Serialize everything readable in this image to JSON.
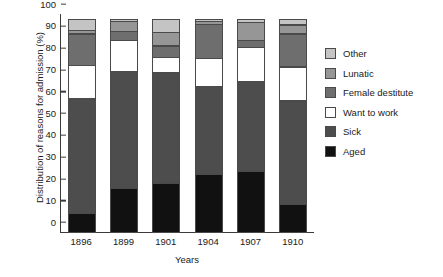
{
  "chart_data": {
    "type": "bar",
    "stacked": true,
    "title": "",
    "xlabel": "Years",
    "ylabel": "Distribution of reasons for admission (%)",
    "categories": [
      "1896",
      "1899",
      "1901",
      "1904",
      "1907",
      "1910"
    ],
    "ylim": [
      0,
      100
    ],
    "yticks": [
      0,
      10,
      20,
      30,
      40,
      50,
      60,
      70,
      80,
      90,
      100
    ],
    "ytick_labels": [
      "0",
      "10",
      "20",
      "30",
      "40",
      "50",
      "60",
      "70",
      "80",
      "90",
      "100"
    ],
    "grid": false,
    "legend_position": "right",
    "units": "percent",
    "series": [
      {
        "name": "Aged",
        "color": "#111111",
        "values": [
          9.0,
          20.5,
          23.0,
          27.0,
          28.5,
          13.0
        ]
      },
      {
        "name": "Sick",
        "color": "#4d4d4d",
        "values": [
          53.0,
          54.0,
          51.0,
          40.5,
          41.5,
          48.0
        ]
      },
      {
        "name": "Want to work",
        "color": "#ffffff",
        "values": [
          15.5,
          14.5,
          7.5,
          13.5,
          16.0,
          16.0
        ]
      },
      {
        "name": "Female destitute",
        "color": "#6e6e6e",
        "values": [
          15.0,
          4.5,
          5.5,
          16.0,
          3.5,
          15.5
        ]
      },
      {
        "name": "Lunatic",
        "color": "#969696",
        "values": [
          2.0,
          5.0,
          6.5,
          1.5,
          8.5,
          4.5
        ]
      },
      {
        "name": "Other",
        "color": "#c4c4c4",
        "values": [
          5.5,
          1.5,
          6.5,
          1.5,
          2.0,
          3.0
        ]
      }
    ],
    "cumulative_tops": {
      "1896": [
        9.0,
        62.0,
        77.5,
        92.5,
        94.5,
        100.0
      ],
      "1899": [
        20.5,
        74.5,
        89.0,
        93.5,
        98.5,
        100.0
      ],
      "1901": [
        23.0,
        74.0,
        81.5,
        87.0,
        93.5,
        100.0
      ],
      "1904": [
        27.0,
        67.5,
        81.0,
        97.0,
        98.5,
        100.0
      ],
      "1907": [
        28.5,
        70.0,
        86.0,
        89.5,
        98.0,
        100.0
      ],
      "1910": [
        13.0,
        61.0,
        77.0,
        92.5,
        97.0,
        100.0
      ]
    }
  },
  "legend": {
    "items": [
      {
        "label": "Other",
        "color": "#c4c4c4"
      },
      {
        "label": "Lunatic",
        "color": "#969696"
      },
      {
        "label": "Female destitute",
        "color": "#6e6e6e"
      },
      {
        "label": "Want to work",
        "color": "#ffffff"
      },
      {
        "label": "Sick",
        "color": "#4d4d4d"
      },
      {
        "label": "Aged",
        "color": "#111111"
      }
    ]
  }
}
